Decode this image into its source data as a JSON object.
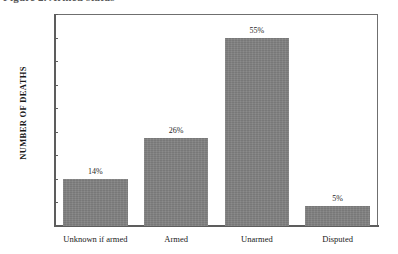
{
  "figure": {
    "caption": "Figure 2. Armed status"
  },
  "chart_data": {
    "type": "bar",
    "title": "Figure 2. Armed status",
    "xlabel": "",
    "ylabel": "NUMBER OF DEATHS",
    "ylim": [
      0,
      225
    ],
    "yticks": [
      0,
      25,
      50,
      75,
      100,
      125,
      150,
      175,
      200,
      225
    ],
    "ytick_labels": [
      "0",
      "25",
      "50",
      "75",
      "100",
      "125",
      "150",
      "175",
      "200",
      "225"
    ],
    "grid": false,
    "legend": "none",
    "categories": [
      "Unknown if armed",
      "Armed",
      "Unarmed",
      "Disputed"
    ],
    "values": [
      50,
      93,
      200,
      21
    ],
    "data_labels": [
      "14%",
      "26%",
      "55%",
      "5%"
    ],
    "series": [
      {
        "name": "Number of deaths",
        "values": [
          50,
          93,
          200,
          21
        ]
      }
    ],
    "bar_color": "#808080"
  }
}
